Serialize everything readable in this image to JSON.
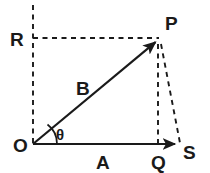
{
  "figure": {
    "background_color": "#ffffff",
    "ink_color": "#1a1a1a",
    "width": 210,
    "height": 173
  },
  "points": {
    "origin": {
      "label": "O",
      "x": 33,
      "y": 144,
      "label_x": 20,
      "label_y": 152
    },
    "tip": {
      "label": "P",
      "x": 158,
      "y": 40,
      "label_x": 166,
      "label_y": 30
    },
    "foot": {
      "label": "Q",
      "x": 158,
      "y": 144,
      "label_x": 156,
      "label_y": 168
    },
    "axis_end": {
      "label": "S",
      "x": 180,
      "y": 144,
      "label_x": 184,
      "label_y": 159
    },
    "projection": {
      "label": "R",
      "x": 33,
      "y": 38,
      "label_x": 10,
      "label_y": 46
    }
  },
  "vectors": [
    {
      "name": "A",
      "label": "A",
      "label_x": 102,
      "label_y": 168,
      "from": "origin",
      "to": "axis_end",
      "style": "solid",
      "arrow": true,
      "x1": 33,
      "y1": 144,
      "x2": 179,
      "y2": 144
    },
    {
      "name": "B",
      "label": "B",
      "label_x": 84,
      "label_y": 94,
      "from": "origin",
      "to": "tip",
      "style": "solid",
      "arrow": true,
      "x1": 33,
      "y1": 144,
      "x2": 158,
      "y2": 40
    }
  ],
  "angle": {
    "label": "θ",
    "label_x": 56,
    "label_y": 141,
    "vertex": "origin",
    "between": [
      "A",
      "B"
    ],
    "radius": 24
  },
  "construction_lines": [
    {
      "name": "vertical-axis-dashed",
      "style": "dashed",
      "x1": 33,
      "y1": 5,
      "x2": 33,
      "y2": 144
    },
    {
      "name": "horizontal-projection-dashed",
      "style": "dashed",
      "x1": 33,
      "y1": 38,
      "x2": 159,
      "y2": 38
    },
    {
      "name": "drop-to-q-dashed",
      "style": "dashed",
      "x1": 158,
      "y1": 43,
      "x2": 158,
      "y2": 144
    },
    {
      "name": "p-to-s-dashed",
      "style": "dashed",
      "x1": 161,
      "y1": 43,
      "x2": 180,
      "y2": 143
    }
  ],
  "labels": {
    "R": "R",
    "P": "P",
    "B": "B",
    "O": "O",
    "theta": "θ",
    "A": "A",
    "Q": "Q",
    "S": "S"
  }
}
